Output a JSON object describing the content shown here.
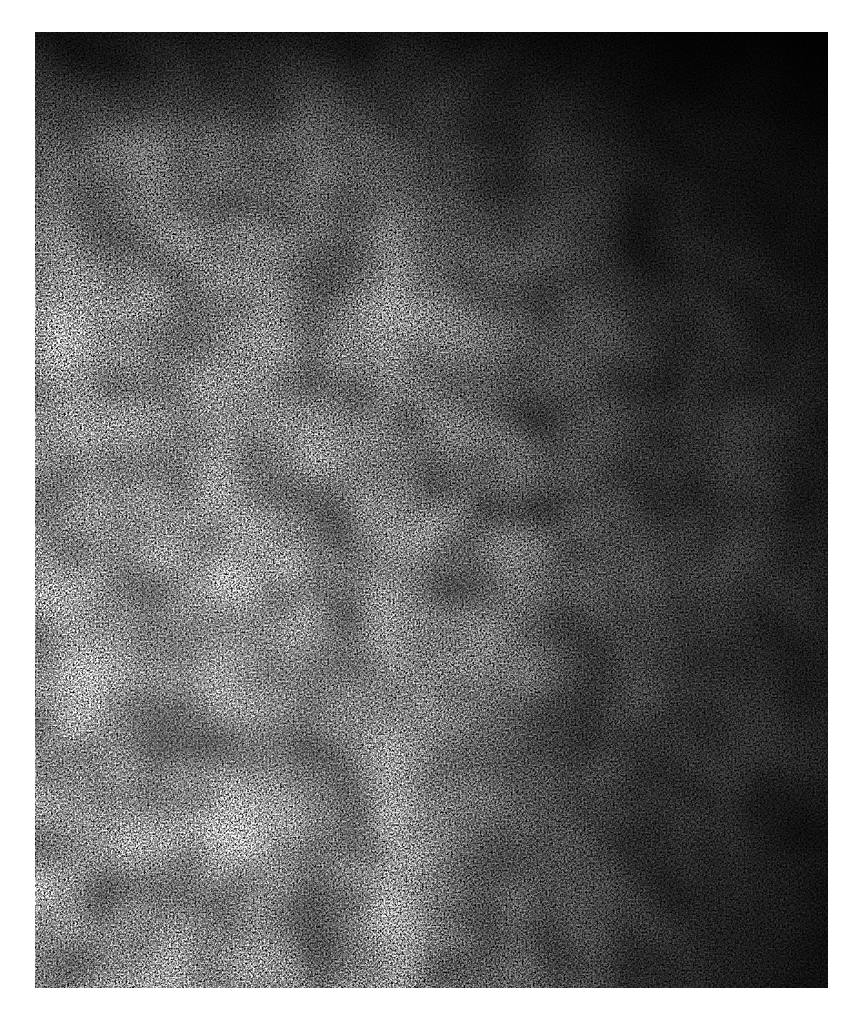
{
  "page": {
    "background": "#ffffff"
  },
  "image": {
    "subject": "grayscale speckle texture",
    "description": "Granular black-and-white noise texture, brighter toward the lower-left and darker toward the top and right edges",
    "colors": {
      "dark": "#050505",
      "mid": "#5a5a5a",
      "light": "#d8d8d8"
    },
    "bounds": {
      "left": 35,
      "top": 32,
      "width": 793,
      "height": 956
    }
  }
}
